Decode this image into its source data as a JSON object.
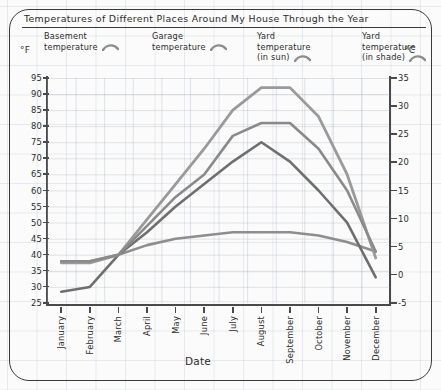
{
  "title": "Temperatures of Different Places Around My House Through the Year",
  "axis": {
    "f_unit": "°F",
    "c_unit": "°C",
    "x_title": "Date",
    "f_ticks": [
      "95",
      "90",
      "85",
      "80",
      "75",
      "70",
      "65",
      "60",
      "55",
      "50",
      "45",
      "40",
      "35",
      "30",
      "25"
    ],
    "c_ticks": [
      "35",
      "30",
      "25",
      "20",
      "15",
      "10",
      "5",
      "0",
      "-5"
    ]
  },
  "legend": [
    {
      "l1": "Basement",
      "l2": "temperature",
      "l3": ""
    },
    {
      "l1": "Garage",
      "l2": "temperature",
      "l3": ""
    },
    {
      "l1": "Yard",
      "l2": "temperature",
      "l3": "(in sun)"
    },
    {
      "l1": "Yard",
      "l2": "temperature",
      "l3": "(in shade)"
    }
  ],
  "colors": {
    "basement": "#8e8e8e",
    "garage": "#6f6f6f",
    "yard_sun": "#9a9a9a",
    "yard_shade": "#8a8a8a",
    "ink": "#2b2b2b",
    "grid": "#96a5b4"
  },
  "chart_data": {
    "type": "line",
    "title": "Temperatures of Different Places Around My House Through the Year",
    "xlabel": "Date",
    "ylabel": "°F",
    "ylabel_right": "°C",
    "ylim": [
      25,
      95
    ],
    "ylim_right": [
      -5,
      35
    ],
    "grid": true,
    "legend_position": "top",
    "categories": [
      "January",
      "February",
      "March",
      "April",
      "May",
      "June",
      "July",
      "August",
      "September",
      "October",
      "November",
      "December"
    ],
    "series": [
      {
        "name": "Basement temperature",
        "values": [
          38,
          38,
          40,
          43,
          45,
          46,
          47,
          47,
          47,
          46,
          44,
          41
        ]
      },
      {
        "name": "Garage temperature",
        "values": [
          28.5,
          30,
          40,
          47,
          55,
          62,
          69,
          75,
          69,
          60,
          50,
          33
        ]
      },
      {
        "name": "Yard temperature (in sun)",
        "values": [
          37.5,
          37.5,
          40,
          51,
          62,
          73,
          85,
          92,
          92,
          83,
          65,
          39
        ]
      },
      {
        "name": "Yard temperature (in shade)",
        "values": [
          38,
          38,
          40,
          49,
          58,
          65,
          77,
          81,
          81,
          73,
          60,
          41
        ]
      }
    ]
  }
}
